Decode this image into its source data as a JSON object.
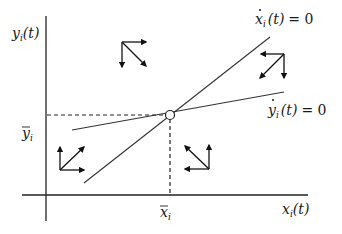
{
  "diagram": {
    "type": "phase-diagram",
    "axes": {
      "x_label": "x",
      "x_sub": "i",
      "x_arg": "(t)",
      "y_label": "y",
      "y_sub": "i",
      "y_arg": "(t)"
    },
    "equilibrium": {
      "x_label": "x",
      "x_sub": "i",
      "y_label": "y",
      "y_sub": "i"
    },
    "nullclines": [
      {
        "name": "x-dot-nullcline",
        "var": "x",
        "sub": "i",
        "arg": "(t)",
        "eq": "= 0"
      },
      {
        "name": "y-dot-nullcline",
        "var": "y",
        "sub": "i",
        "arg": "(t)",
        "eq": "= 0"
      }
    ],
    "arrow_clusters": [
      {
        "region": "upper-left",
        "directions": [
          "right",
          "down",
          "down-right"
        ]
      },
      {
        "region": "upper-right",
        "directions": [
          "left",
          "down",
          "down-left"
        ]
      },
      {
        "region": "lower-left",
        "directions": [
          "up",
          "right",
          "up-right"
        ]
      },
      {
        "region": "lower-right",
        "directions": [
          "up",
          "left",
          "up-left"
        ]
      }
    ],
    "colors": {
      "ink": "#1a1a1a",
      "line": "#333333",
      "background": "#ffffff"
    }
  }
}
